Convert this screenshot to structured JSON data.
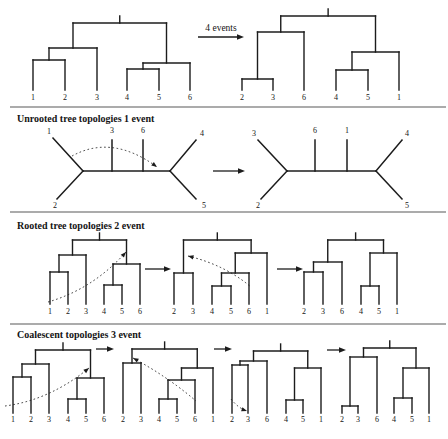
{
  "figure": {
    "transition_label": "4 events",
    "section_titles": [
      "Unrooted tree topologies 1 event",
      "Rooted tree topologies 2 event",
      "Coalescent topologies 3 event"
    ]
  },
  "colors": {
    "line": "#1c1c1c",
    "divider": "#8f8f8f",
    "text": "#141414"
  },
  "rooted_trees": [
    {
      "name": "tree-top-left",
      "newick": "(((1,2),3),((4,5),6))",
      "leaf_labels": [
        "1",
        "2",
        "3",
        "4",
        "5",
        "6"
      ],
      "leaf_x": [
        33,
        65,
        97,
        127,
        159,
        190
      ],
      "tip_y": 90,
      "label_y": 100,
      "topology": {
        "y": 23,
        "c": [
          {
            "y": 48,
            "c": [
              {
                "y": 60,
                "c": [
                  0,
                  1
                ]
              },
              2
            ]
          },
          {
            "y": 63,
            "c": [
              {
                "y": 69,
                "c": [
                  3,
                  4
                ]
              },
              5
            ]
          }
        ]
      }
    },
    {
      "name": "tree-top-right",
      "newick": "(((2,3),6),((4,5),1))",
      "leaf_labels": [
        "2",
        "3",
        "6",
        "4",
        "5",
        "1"
      ],
      "leaf_x": [
        242,
        273,
        304,
        336,
        368,
        399
      ],
      "tip_y": 90,
      "label_y": 100,
      "topology": {
        "y": 16,
        "c": [
          {
            "y": 32,
            "c": [
              {
                "y": 79,
                "c": [
                  0,
                  1
                ]
              },
              2
            ]
          },
          {
            "y": 52,
            "c": [
              {
                "y": 70,
                "c": [
                  3,
                  4
                ]
              },
              5
            ]
          }
        ]
      }
    },
    {
      "name": "rooted-tree-1",
      "newick": "(((1,2),3),((4,5),6))",
      "leaf_labels": [
        "1",
        "2",
        "3",
        "4",
        "5",
        "6"
      ],
      "leaf_x": [
        50,
        68,
        86,
        104,
        122,
        140
      ],
      "tip_y": 304,
      "label_y": 314,
      "topology": {
        "y": 240,
        "c": [
          {
            "y": 255,
            "c": [
              {
                "y": 272,
                "c": [
                  0,
                  1
                ]
              },
              2
            ]
          },
          {
            "y": 264,
            "c": [
              {
                "y": 285,
                "c": [
                  3,
                  4
                ]
              },
              5
            ]
          }
        ]
      }
    },
    {
      "name": "rooted-tree-2",
      "newick": "((2,3),(((4,5),6),1))",
      "leaf_labels": [
        "2",
        "3",
        "4",
        "5",
        "6",
        "1"
      ],
      "leaf_x": [
        174,
        193,
        212,
        231,
        249,
        267
      ],
      "tip_y": 304,
      "label_y": 314,
      "topology": {
        "y": 240,
        "c": [
          {
            "y": 273,
            "c": [
              0,
              1
            ]
          },
          {
            "y": 253,
            "c": [
              {
                "y": 273,
                "c": [
                  {
                    "y": 286,
                    "c": [
                      2,
                      3
                    ]
                  },
                  4
                ]
              },
              5
            ]
          }
        ]
      }
    },
    {
      "name": "rooted-tree-3",
      "newick": "(((2,3),6),((4,5),1))",
      "leaf_labels": [
        "2",
        "3",
        "6",
        "4",
        "5",
        "1"
      ],
      "leaf_x": [
        304,
        323,
        342,
        361,
        379,
        397
      ],
      "tip_y": 304,
      "label_y": 314,
      "topology": {
        "y": 240,
        "c": [
          {
            "y": 262,
            "c": [
              {
                "y": 272,
                "c": [
                  0,
                  1
                ]
              },
              2
            ]
          },
          {
            "y": 253,
            "c": [
              {
                "y": 286,
                "c": [
                  3,
                  4
                ]
              },
              5
            ]
          }
        ]
      }
    },
    {
      "name": "coalescent-tree-1",
      "newick": "(((1,2),3),((4,5),6))",
      "leaf_labels": [
        "1",
        "2",
        "3",
        "4",
        "5",
        "6"
      ],
      "leaf_x": [
        13,
        31,
        49,
        68,
        86,
        104
      ],
      "tip_y": 413,
      "label_y": 422,
      "topology": {
        "y": 350,
        "c": [
          {
            "y": 364,
            "c": [
              {
                "y": 377,
                "c": [
                  0,
                  1
                ]
              },
              2
            ]
          },
          {
            "y": 378,
            "c": [
              {
                "y": 399,
                "c": [
                  3,
                  4
                ]
              },
              5
            ]
          }
        ]
      }
    },
    {
      "name": "coalescent-tree-2",
      "newick": "((2,3),(((4,5),6),1))",
      "leaf_labels": [
        "2",
        "3",
        "4",
        "5",
        "6",
        "1"
      ],
      "leaf_x": [
        123,
        141,
        159,
        177,
        195,
        213
      ],
      "tip_y": 413,
      "label_y": 422,
      "topology": {
        "y": 349,
        "c": [
          {
            "y": 363,
            "c": [
              0,
              1
            ]
          },
          {
            "y": 368,
            "c": [
              {
                "y": 380,
                "c": [
                  {
                    "y": 399,
                    "c": [
                      2,
                      3
                    ]
                  },
                  4
                ]
              },
              5
            ]
          }
        ]
      }
    },
    {
      "name": "coalescent-tree-3",
      "newick": "(((2,3),6),((4,5),1))",
      "leaf_labels": [
        "2",
        "3",
        "6",
        "4",
        "5",
        "1"
      ],
      "leaf_x": [
        232,
        248,
        267,
        286,
        303,
        321
      ],
      "tip_y": 413,
      "label_y": 422,
      "topology": {
        "y": 351,
        "c": [
          {
            "y": 361,
            "c": [
              {
                "y": 365,
                "c": [
                  0,
                  1
                ]
              },
              2
            ]
          },
          {
            "y": 368,
            "c": [
              {
                "y": 400,
                "c": [
                  3,
                  4
                ]
              },
              5
            ]
          }
        ]
      }
    },
    {
      "name": "coalescent-tree-4",
      "newick": "(((2,3),6),((4,5),1))",
      "leaf_labels": [
        "2",
        "3",
        "6",
        "4",
        "5",
        "1"
      ],
      "leaf_x": [
        342,
        358,
        377,
        394,
        412,
        429
      ],
      "tip_y": 413,
      "label_y": 422,
      "topology": {
        "y": 348,
        "c": [
          {
            "y": 357,
            "c": [
              {
                "y": 406,
                "c": [
                  0,
                  1
                ]
              },
              2
            ]
          },
          {
            "y": 368,
            "c": [
              {
                "y": 398,
                "c": [
                  3,
                  4
                ]
              },
              5
            ]
          }
        ]
      }
    }
  ],
  "unrooted_trees": [
    {
      "name": "unrooted-tree-left",
      "newick": "((1,2),3,6,(4,5))",
      "segments": [
        [
          83,
          171,
          170,
          171
        ],
        [
          83,
          171,
          53,
          138
        ],
        [
          83,
          171,
          57,
          199
        ],
        [
          112,
          171,
          112,
          140
        ],
        [
          143,
          171,
          143,
          140
        ],
        [
          170,
          171,
          196,
          140
        ],
        [
          170,
          171,
          196,
          199
        ]
      ],
      "labels": [
        {
          "t": "1",
          "x": 49,
          "y": 134
        },
        {
          "t": "2",
          "x": 55,
          "y": 208
        },
        {
          "t": "3",
          "x": 112,
          "y": 133
        },
        {
          "t": "6",
          "x": 143,
          "y": 133
        },
        {
          "t": "4",
          "x": 202,
          "y": 136
        },
        {
          "t": "5",
          "x": 204,
          "y": 208
        }
      ]
    },
    {
      "name": "unrooted-tree-right",
      "newick": "((3,2),6,1,(4,5))",
      "segments": [
        [
          287,
          171,
          376,
          171
        ],
        [
          287,
          171,
          258,
          140
        ],
        [
          287,
          171,
          261,
          199
        ],
        [
          315,
          171,
          315,
          140
        ],
        [
          347,
          171,
          347,
          140
        ],
        [
          376,
          171,
          402,
          140
        ],
        [
          376,
          171,
          402,
          199
        ]
      ],
      "labels": [
        {
          "t": "3",
          "x": 254,
          "y": 136
        },
        {
          "t": "2",
          "x": 258,
          "y": 208
        },
        {
          "t": "6",
          "x": 315,
          "y": 133
        },
        {
          "t": "1",
          "x": 347,
          "y": 133
        },
        {
          "t": "4",
          "x": 407,
          "y": 136
        },
        {
          "t": "5",
          "x": 407,
          "y": 208
        }
      ]
    }
  ],
  "event_arcs": [
    {
      "name": "event-arc-unrooted",
      "p0": [
        72,
        156
      ],
      "c": [
        112,
        134
      ],
      "p1": [
        157,
        167
      ],
      "arrow": "end"
    },
    {
      "name": "event-arc-rooted-1",
      "p0": [
        48,
        302
      ],
      "c": [
        93,
        289
      ],
      "p1": [
        126,
        252
      ],
      "arrow": "end"
    },
    {
      "name": "event-arc-rooted-2",
      "p0": [
        188,
        256
      ],
      "c": [
        225,
        265
      ],
      "p1": [
        251,
        287
      ],
      "arrow": "start"
    },
    {
      "name": "event-arc-coalescent-1",
      "p0": [
        5,
        406
      ],
      "c": [
        50,
        400
      ],
      "p1": [
        89,
        368
      ],
      "arrow": "end"
    },
    {
      "name": "event-arc-coalescent-2",
      "p0": [
        133,
        358
      ],
      "c": [
        168,
        377
      ],
      "p1": [
        196,
        401
      ],
      "arrow": "start"
    },
    {
      "name": "event-arc-coalescent-3",
      "p0": [
        231,
        399
      ],
      "c": [
        238,
        408
      ],
      "p1": [
        247,
        411
      ],
      "arrow": "end"
    }
  ],
  "transition_arrows": [
    {
      "name": "transition-arrow-top",
      "x1": 198,
      "y": 37,
      "x2": 244
    },
    {
      "name": "transition-arrow-unrooted",
      "x1": 213,
      "y": 171,
      "x2": 245
    },
    {
      "name": "transition-arrow-rooted-1",
      "x1": 145,
      "y": 269,
      "x2": 171
    },
    {
      "name": "transition-arrow-rooted-2",
      "x1": 277,
      "y": 269,
      "x2": 303
    },
    {
      "name": "transition-arrow-coalescent-1",
      "x1": 96,
      "y": 349,
      "x2": 114
    },
    {
      "name": "transition-arrow-coalescent-2",
      "x1": 214,
      "y": 349,
      "x2": 232
    },
    {
      "name": "transition-arrow-coalescent-3",
      "x1": 327,
      "y": 350,
      "x2": 346
    }
  ]
}
